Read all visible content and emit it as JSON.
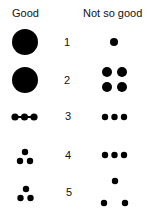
{
  "headers": {
    "good": "Good",
    "not_so_good": "Not so good"
  },
  "rows": [
    {
      "number": "1",
      "good": "one large dot",
      "not_so_good": "one small dot"
    },
    {
      "number": "2",
      "good": "one large dot",
      "not_so_good": "four dots in a 2x2 grid"
    },
    {
      "number": "3",
      "good": "three touching dots in a line",
      "not_so_good": "three separated dots in a line"
    },
    {
      "number": "4",
      "good": "three dots in a tight triangle",
      "not_so_good": "three separated dots in a line"
    },
    {
      "number": "5",
      "good": "three dots in a tight triangle",
      "not_so_good": "three widely spaced dots in a triangle"
    }
  ],
  "colors": {
    "dot": "#000000",
    "background": "#ffffff"
  }
}
